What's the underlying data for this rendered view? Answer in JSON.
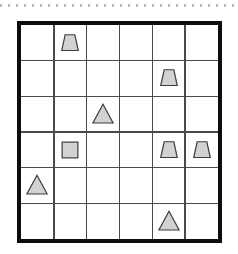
{
  "puzzle": {
    "title": "shape-grid-puzzle",
    "grid": {
      "rows": 6,
      "cols": 6,
      "left": 17,
      "top": 21,
      "right": 222,
      "bottom": 243,
      "cell_width": 34.17,
      "cell_height": 37.0,
      "outer_border_width": 4,
      "outer_border_color": "#0d0d0d",
      "inner_line_width": 1.6,
      "inner_line_color": "#4a4a4a",
      "background": "#ffffff"
    },
    "shape_style": {
      "fill": "#d2d2d2",
      "stroke": "#3d3d3d",
      "stroke_width": 1.6
    },
    "top_rule": {
      "name": "dotted-rule",
      "color": "#b9b9bf",
      "dot_width": 2,
      "dot_gap": 6,
      "y": 4
    },
    "shapes": [
      {
        "id": "shape-1",
        "type": "trapezoid",
        "row": 1,
        "col": 2,
        "label": "trapezoid-r1c2",
        "size": 24
      },
      {
        "id": "shape-2",
        "type": "trapezoid",
        "row": 2,
        "col": 5,
        "label": "trapezoid-r2c5",
        "size": 24
      },
      {
        "id": "shape-3",
        "type": "triangle",
        "row": 3,
        "col": 3,
        "label": "triangle-r3c3",
        "size": 26
      },
      {
        "id": "shape-4",
        "type": "square",
        "row": 4,
        "col": 2,
        "label": "square-r4c2",
        "size": 22
      },
      {
        "id": "shape-5",
        "type": "trapezoid",
        "row": 4,
        "col": 5,
        "label": "trapezoid-r4c5",
        "size": 24
      },
      {
        "id": "shape-6",
        "type": "trapezoid",
        "row": 4,
        "col": 6,
        "label": "trapezoid-r4c6",
        "size": 24
      },
      {
        "id": "shape-7",
        "type": "triangle",
        "row": 5,
        "col": 1,
        "label": "triangle-r5c1",
        "size": 26
      },
      {
        "id": "shape-8",
        "type": "triangle",
        "row": 6,
        "col": 5,
        "label": "triangle-r6c5",
        "size": 26
      }
    ]
  }
}
